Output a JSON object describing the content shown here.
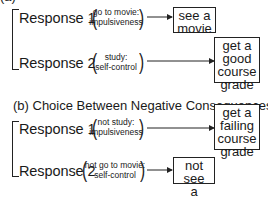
{
  "diagram": {
    "section_a": {
      "title_partial": "(a)",
      "responses": [
        {
          "label": "Response 1",
          "detail_line1": "go to movie:",
          "detail_line2": "impulsiveness",
          "consequence_lines": [
            "see a",
            "movie"
          ]
        },
        {
          "label": "Response 2",
          "detail_line1": "study:",
          "detail_line2": "self-control",
          "consequence_lines": [
            "get a",
            "good",
            "course",
            "grade"
          ]
        }
      ]
    },
    "section_b": {
      "title": "(b) Choice Between Negative Consequences",
      "responses": [
        {
          "label": "Response 1",
          "detail_line1": "not study:",
          "detail_line2": "impulsiveness",
          "consequence_lines": [
            "get a",
            "failing",
            "course",
            "grade"
          ]
        },
        {
          "label": "Response 2",
          "detail_line1": "not go to movie:",
          "detail_line2": "self-control",
          "consequence_lines": [
            "not see",
            "a movie"
          ]
        }
      ]
    },
    "colors": {
      "line": "#222222",
      "text": "#1a1a1a",
      "background": "#ffffff"
    }
  }
}
